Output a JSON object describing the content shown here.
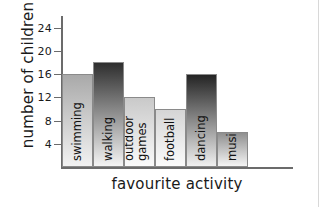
{
  "chart_data": {
    "type": "bar",
    "title": "",
    "xlabel": "favourite activity",
    "ylabel": "number of children",
    "categories": [
      "swimming",
      "walking",
      "outdoor games",
      "football",
      "dancing",
      "music"
    ],
    "values": [
      16,
      18,
      12,
      10,
      16,
      6
    ],
    "ylim": [
      0,
      26
    ],
    "yticks": [
      4,
      8,
      12,
      16,
      20,
      24
    ],
    "ytick_labels": [
      "4",
      "8",
      "12",
      "16",
      "20",
      "24"
    ],
    "grid": false,
    "legend": false,
    "bar_styles": [
      {
        "category": "swimming",
        "top_color": "#a9a9a9",
        "bottom_color": "#f2f2f2"
      },
      {
        "category": "walking",
        "top_color": "#2e2e2e",
        "bottom_color": "#f4f4f4"
      },
      {
        "category": "outdoor games",
        "top_color": "#c9c9c9",
        "bottom_color": "#fafafa"
      },
      {
        "category": "football",
        "top_color": "#d5d5d5",
        "bottom_color": "#fbfbfb"
      },
      {
        "category": "dancing",
        "top_color": "#242424",
        "bottom_color": "#f0f0f0"
      },
      {
        "category": "music",
        "top_color": "#8f8f8f",
        "bottom_color": "#f4f4f4"
      }
    ],
    "bar_label_lines": [
      [
        "swimming"
      ],
      [
        "walking"
      ],
      [
        "outdoor",
        "games"
      ],
      [
        "football"
      ],
      [
        "dancing"
      ],
      [
        "music"
      ]
    ]
  },
  "colors": {
    "axis": "#6b6b6b",
    "text": "#1a1a1a",
    "background": "#ffffff",
    "bar_border": "#8a8a8a"
  }
}
